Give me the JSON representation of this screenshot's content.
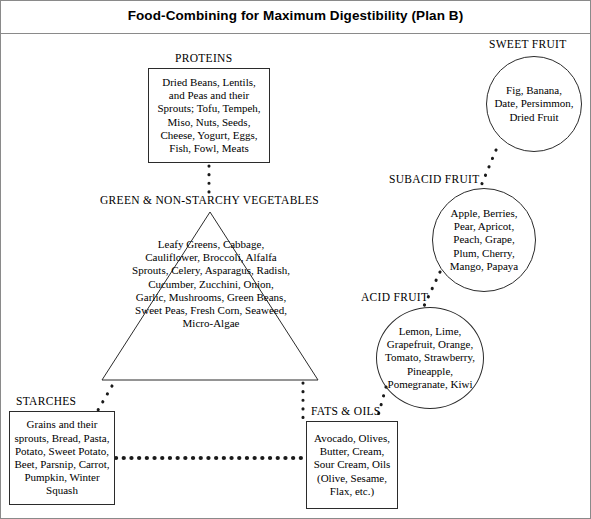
{
  "title": "Food-Combining for Maximum Digestibility (Plan B)",
  "groups": {
    "proteins": {
      "label": "PROTEINS",
      "items": "Dried Beans, Lentils, and Peas and their Sprouts; Tofu, Tempeh, Miso, Nuts, Seeds, Cheese, Yogurt, Eggs, Fish, Fowl, Meats",
      "shape": "box"
    },
    "vegetables": {
      "label": "GREEN & NON-STARCHY VEGETABLES",
      "items": "Leafy Greens, Cabbage, Cauliflower, Broccoli, Alfalfa Sprouts, Celery, Asparagus, Radish, Cucumber, Zucchini, Onion, Garlic, Mushrooms, Green Beans, Sweet Peas, Fresh Corn, Seaweed, Micro-Algae",
      "shape": "triangle"
    },
    "starches": {
      "label": "STARCHES",
      "items": "Grains and their sprouts, Bread, Pasta, Potato, Sweet Potato, Beet, Parsnip, Carrot, Pumpkin, Winter Squash",
      "shape": "box"
    },
    "fats_oils": {
      "label": "FATS & OILS",
      "items": "Avocado, Olives, Butter, Cream, Sour Cream, Oils (Olive, Sesame, Flax, etc.)",
      "shape": "box"
    },
    "sweet_fruit": {
      "label": "SWEET FRUIT",
      "items": "Fig, Banana, Date, Persimmon, Dried Fruit",
      "shape": "circle"
    },
    "subacid_fruit": {
      "label": "SUBACID FRUIT",
      "items": "Apple, Berries, Pear, Apricot, Peach, Grape, Plum, Cherry, Mango, Papaya",
      "shape": "circle"
    },
    "acid_fruit": {
      "label": "ACID FRUIT",
      "items": "Lemon, Lime, Grapefruit, Orange, Tomato, Strawberry, Pineapple, Pomegranate, Kiwi",
      "shape": "circle"
    }
  },
  "connections": [
    {
      "from": "proteins",
      "to": "vegetables",
      "style": "dotted"
    },
    {
      "from": "vegetables",
      "to": "starches",
      "style": "dotted"
    },
    {
      "from": "vegetables",
      "to": "fats_oils",
      "style": "dotted"
    },
    {
      "from": "starches",
      "to": "fats_oils",
      "style": "dotted"
    },
    {
      "from": "sweet_fruit",
      "to": "subacid_fruit",
      "style": "dotted"
    },
    {
      "from": "subacid_fruit",
      "to": "acid_fruit",
      "style": "dotted"
    },
    {
      "from": "acid_fruit",
      "to": "fats_oils",
      "style": "dotted"
    }
  ],
  "colors": {
    "line": "#2b2b2b",
    "frame": "#8a8a8a",
    "text": "#000000",
    "background": "#ffffff"
  }
}
